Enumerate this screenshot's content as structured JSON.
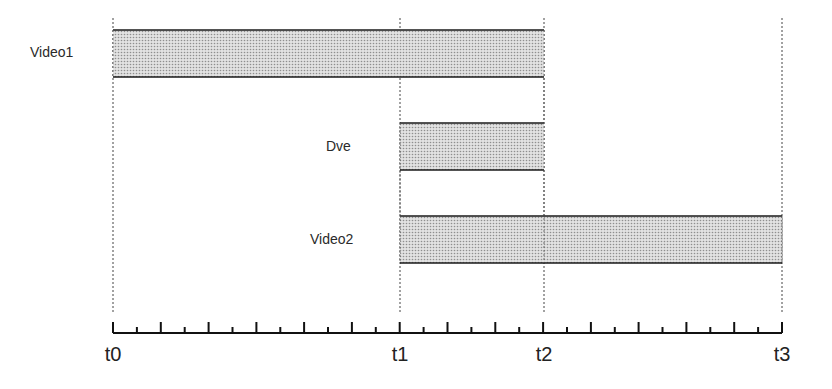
{
  "diagram": {
    "type": "timeline",
    "tracks": [
      {
        "name": "Video1",
        "start": "t0",
        "end": "t2"
      },
      {
        "name": "Dve",
        "start": "t1",
        "end": "t2"
      },
      {
        "name": "Video2",
        "start": "t1",
        "end": "t3"
      }
    ],
    "time_markers": [
      {
        "label": "t0",
        "x": 113
      },
      {
        "label": "t1",
        "x": 400
      },
      {
        "label": "t2",
        "x": 544
      },
      {
        "label": "t3",
        "x": 782
      }
    ],
    "axis": {
      "x_start": 113,
      "x_end": 782,
      "tick_spacing": 23.9,
      "tick_count": 28
    },
    "colors": {
      "bar_fill": "#d6d6d6",
      "bar_dot": "#9a9a9a",
      "line": "#1a1a1a",
      "guide": "#444444"
    }
  },
  "labels": {
    "video1": "Video1",
    "dve": "Dve",
    "video2": "Video2",
    "t0": "t0",
    "t1": "t1",
    "t2": "t2",
    "t3": "t3"
  }
}
